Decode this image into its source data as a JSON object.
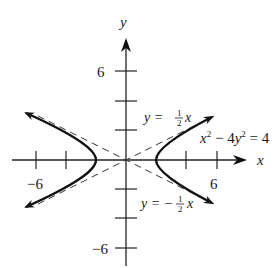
{
  "figure": {
    "type": "hyperbola-graph",
    "equation": "x² − 4y² = 4",
    "axes": {
      "x_label": "x",
      "y_label": "y",
      "x_ticks": [
        -6,
        -4,
        4,
        6
      ],
      "y_ticks": [
        -6,
        -4,
        -2,
        2,
        4,
        6
      ],
      "x_tick_labels": [
        "−6",
        "6"
      ],
      "y_tick_labels": [
        "6",
        "−6"
      ]
    },
    "asymptotes": [
      {
        "label_lhs": "y =",
        "numerator": "1",
        "denominator": "2",
        "var": "x",
        "slope": 0.5
      },
      {
        "label_lhs": "y = −",
        "numerator": "1",
        "denominator": "2",
        "var": "x",
        "slope": -0.5
      }
    ],
    "curve_label": {
      "x": "x",
      "exp1": "2",
      "mid": " − 4",
      "y": "y",
      "exp2": "2",
      "rhs": " = 4"
    },
    "vertices": [
      [
        -2,
        0
      ],
      [
        2,
        0
      ]
    ],
    "colors": {
      "curve": "#111111",
      "axis": "#222222",
      "asymptote": "#333333"
    }
  }
}
